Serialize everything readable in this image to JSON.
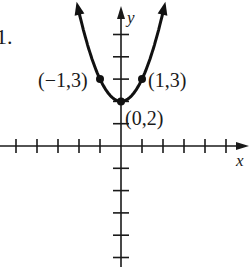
{
  "problem_number": "1.",
  "chart_data": {
    "type": "line",
    "title": "",
    "function": "y = x^2 + 2",
    "xlabel": "x",
    "ylabel": "y",
    "grid": false,
    "xlim": [
      -5.8,
      5.6
    ],
    "ylim": [
      -5.6,
      6.6
    ],
    "x_ticks": [
      -5,
      -4,
      -3,
      -2,
      -1,
      1,
      2,
      3,
      4,
      5
    ],
    "y_ticks": [
      -5,
      -4,
      -3,
      -2,
      -1,
      1,
      2,
      3,
      4,
      5
    ],
    "points": [
      {
        "x": -1,
        "y": 3,
        "label": "(−1,3)"
      },
      {
        "x": 0,
        "y": 2,
        "label": "(0,2)"
      },
      {
        "x": 1,
        "y": 3,
        "label": "(1,3)"
      }
    ],
    "curve_x_range": [
      -2.05,
      2.05
    ],
    "curve_color": "#111111",
    "axis_color": "#1a1a1a"
  }
}
